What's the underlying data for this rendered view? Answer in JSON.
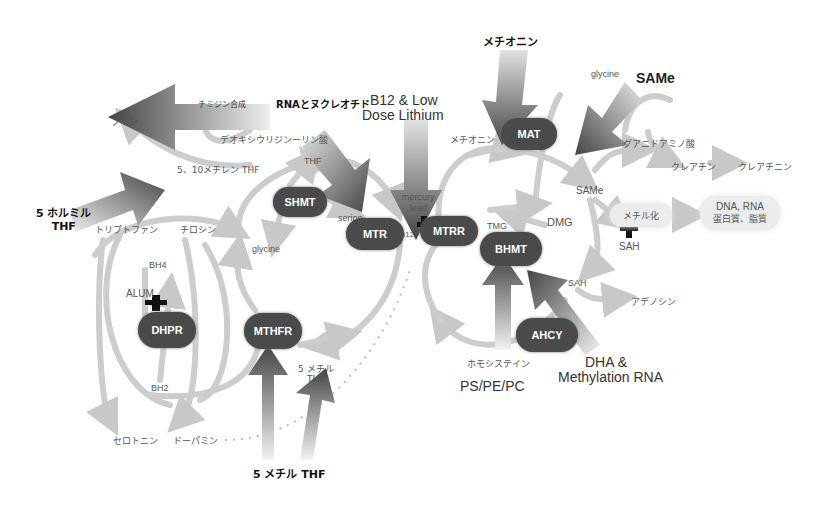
{
  "inputs": {
    "methionine": "メチオニン",
    "same": "SAMe",
    "b12": "B12 & Low",
    "b12_line2": "Dose Lithium",
    "rna": "RNAとヌクレオチド",
    "formyl_thf": "5 ホルミル",
    "formyl_thf_line2": "THF",
    "methyl_thf": "5 メチル THF",
    "dha": "DHA &",
    "dha_line2": "Methylation RNA",
    "ps_pe_pc": "PS/PE/PC"
  },
  "enzymes": {
    "mat": "MAT",
    "shmt": "SHMT",
    "mtr": "MTR",
    "mtrr": "MTRR",
    "bhmt": "BHMT",
    "ahcy": "AHCY",
    "dhpr": "DHPR",
    "mthfr": "MTHFR"
  },
  "metabolites": {
    "thymidine": "チミジン合成",
    "purine": "プリン",
    "deoxyuridine": "デオキシウリジンーリン酸",
    "methylene_thf": "5、10メチレン THF",
    "thf": "THF",
    "serine": "serine",
    "glycine_left": "glycine",
    "mercury": "mercury",
    "lead": "lead",
    "b12_small": "B12",
    "methionine_small": "メチオニン",
    "tmg": "TMG",
    "dmg": "DMG",
    "glycine_right": "glycine",
    "guanidinoacetate": "グアニドアミノ酸",
    "creatine": "クレアチン",
    "creatinine": "クレアチニン",
    "same_small": "SAMe",
    "methylation": "メチル化",
    "dna_rna": "DNA, RNA",
    "protein_lipid": "蛋白質、脂質",
    "sah_inhibitor": "SAH",
    "sah": "SAH",
    "adenosine": "アデノシン",
    "homocysteine": "ホモシステイン",
    "tryptophan": "トリプトファン",
    "tyrosine": "チロシン",
    "bh4": "BH4",
    "alum": "ALUM",
    "bh2": "BH2",
    "serotonin": "セロトニン",
    "dopamine": "ドーパミン",
    "methyl_thf_small": "5 メチル",
    "methyl_thf_small_line2": "THF"
  },
  "colors": {
    "enzyme_fill": "#4a4a4a",
    "flow_arrow": "#cfcfcf",
    "input_arrow_dark": "#4f4f4f",
    "input_arrow_light": "#d8d8d8",
    "inhibitor": "#111111"
  }
}
